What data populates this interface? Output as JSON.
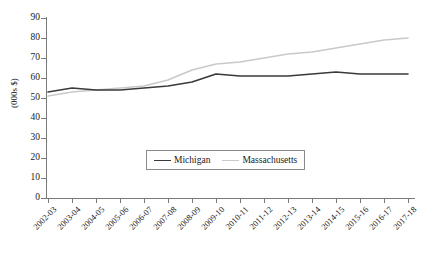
{
  "chart_data": {
    "type": "line",
    "title": "",
    "xlabel": "",
    "ylabel": "(000s $)",
    "ylim": [
      0,
      90
    ],
    "ytick_step": 10,
    "grid": false,
    "legend_position": "inside-bottom-center",
    "categories": [
      "2002-03",
      "2003-04",
      "2004-05",
      "2005-06",
      "2006-07",
      "2007-08",
      "2008-09",
      "2009-10",
      "2010-11",
      "2011-12",
      "2012-13",
      "2013-14",
      "2014-15",
      "2015-16",
      "2016-17",
      "2017-18"
    ],
    "ytick_labels": [
      "0",
      "10",
      "20",
      "30",
      "40",
      "50",
      "60",
      "70",
      "80",
      "90"
    ],
    "series": [
      {
        "name": "Michigan",
        "color": "#3a3a3a",
        "values": [
          53,
          55,
          54,
          54,
          55,
          56,
          58,
          62,
          61,
          61,
          61,
          62,
          63,
          62,
          62,
          62
        ]
      },
      {
        "name": "Massachusetts",
        "color": "#c9c9c9",
        "values": [
          51,
          53,
          54,
          55,
          56,
          59,
          64,
          67,
          68,
          70,
          72,
          73,
          75,
          77,
          79,
          80
        ]
      }
    ]
  },
  "legend": {
    "entries": [
      {
        "label": "Michigan"
      },
      {
        "label": "Massachusetts"
      }
    ]
  },
  "axes": {
    "y_title": "(000s $)"
  },
  "colors": {
    "michigan": "#3a3a3a",
    "massachusetts": "#c9c9c9",
    "axis": "#7a7a7a",
    "text": "#1a1a1a",
    "background": "#ffffff"
  }
}
